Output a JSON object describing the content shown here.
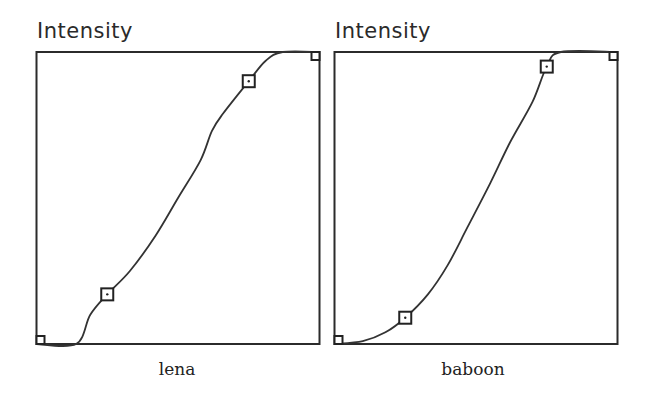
{
  "panels": [
    {
      "title": "Intensity",
      "caption": "lena"
    },
    {
      "title": "Intensity",
      "caption": "baboon"
    }
  ],
  "chart_data": [
    {
      "type": "line",
      "title": "Intensity",
      "xlabel": "lena",
      "ylabel": "Intensity",
      "xlim": [
        0,
        1
      ],
      "ylim": [
        0,
        1
      ],
      "grid": false,
      "legend": null,
      "series": [
        {
          "name": "tone curve",
          "x": [
            0.0,
            0.14,
            0.19,
            0.25,
            0.33,
            0.42,
            0.5,
            0.58,
            0.62,
            0.66,
            0.75,
            0.81,
            0.87,
            1.0
          ],
          "y": [
            0.0,
            0.0,
            0.1,
            0.17,
            0.25,
            0.37,
            0.5,
            0.63,
            0.73,
            0.79,
            0.9,
            0.97,
            1.0,
            1.0
          ]
        }
      ],
      "control_points": [
        {
          "x": 0.0,
          "y": 0.0
        },
        {
          "x": 0.25,
          "y": 0.17
        },
        {
          "x": 0.75,
          "y": 0.9
        },
        {
          "x": 1.0,
          "y": 1.0
        }
      ]
    },
    {
      "type": "line",
      "title": "Intensity",
      "xlabel": "baboon",
      "ylabel": "Intensity",
      "xlim": [
        0,
        1
      ],
      "ylim": [
        0,
        1
      ],
      "grid": false,
      "legend": null,
      "series": [
        {
          "name": "tone curve",
          "x": [
            0.0,
            0.1,
            0.18,
            0.25,
            0.33,
            0.4,
            0.47,
            0.55,
            0.62,
            0.7,
            0.75,
            0.8,
            1.0
          ],
          "y": [
            0.0,
            0.01,
            0.04,
            0.09,
            0.17,
            0.27,
            0.4,
            0.55,
            0.69,
            0.83,
            0.95,
            1.0,
            1.0
          ]
        }
      ],
      "control_points": [
        {
          "x": 0.0,
          "y": 0.0
        },
        {
          "x": 0.25,
          "y": 0.09
        },
        {
          "x": 0.75,
          "y": 0.95
        },
        {
          "x": 1.0,
          "y": 1.0
        }
      ]
    }
  ]
}
